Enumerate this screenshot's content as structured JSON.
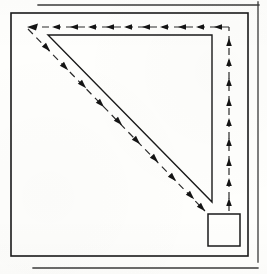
{
  "figure": {
    "kind": "line-drawing",
    "canvas": {
      "width": 267,
      "height": 274
    },
    "background_color": "#fefefc",
    "ink_color": "#1a1a1a",
    "ink_color_light": "#4a4a4a"
  },
  "geometry": {
    "outer_rectangle": {
      "name": "outer-boundary-rectangle",
      "x1": 11,
      "y1": 13,
      "x2": 248,
      "y2": 256,
      "stroke_width": 1.6
    },
    "triangle": {
      "name": "inner-right-triangle",
      "points": [
        {
          "x": 48,
          "y": 35
        },
        {
          "x": 212,
          "y": 35
        },
        {
          "x": 212,
          "y": 202
        }
      ],
      "stroke_width": 1.4,
      "right_angle_at": {
        "x": 212,
        "y": 35
      }
    },
    "small_square": {
      "name": "corner-detail-square",
      "x": 208,
      "y": 214,
      "width": 32,
      "height": 32,
      "stroke_width": 1.5
    },
    "rule_lines": [
      {
        "name": "top-rule-line",
        "x1": 38,
        "y1": 5,
        "x2": 259,
        "y2": 5,
        "stroke_width": 1.3
      },
      {
        "name": "bottom-rule-line",
        "x1": 33,
        "y1": 268,
        "x2": 258,
        "y2": 268,
        "stroke_width": 1.3
      },
      {
        "name": "right-rule-line",
        "x1": 258,
        "y1": 2,
        "x2": 258,
        "y2": 262,
        "stroke_width": 1.3
      }
    ]
  },
  "flow_path": {
    "name": "dashed-arrow-circuit",
    "stroke_width": 1.2,
    "dash_pattern": "7 5",
    "arrowhead_count_total": 27,
    "segments": [
      {
        "name": "top-leftward-dashed-segment",
        "direction": "leftward",
        "x1": 229,
        "y1": 27,
        "x2": 26,
        "y2": 27,
        "arrowheads": 11
      },
      {
        "name": "diagonal-downright-dashed-segment",
        "direction": "down-right",
        "x1": 26,
        "y1": 27,
        "x2": 205,
        "y2": 210,
        "arrowheads": 10
      },
      {
        "name": "right-upward-dashed-segment",
        "direction": "upward",
        "x1": 229,
        "y1": 210,
        "x2": 229,
        "y2": 27,
        "arrowheads": 9
      }
    ]
  }
}
